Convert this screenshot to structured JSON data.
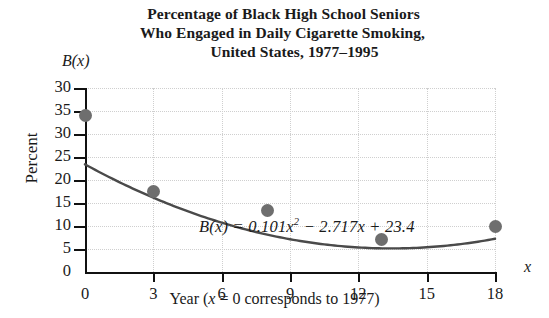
{
  "title": {
    "line1": "Percentage of Black High School Seniors",
    "line2": "Who Engaged in Daily Cigarette Smoking,",
    "line3": "United States, 1977–1995"
  },
  "axes": {
    "y_function_label": "B(x)",
    "y_axis_label": "Percent",
    "x_variable_label": "x",
    "x_axis_caption": "Year (x = 0 corresponds to 1977)"
  },
  "equation": {
    "full": "B(x) = 0.101x² − 2.717x + 23.4",
    "lhs": "B(x)",
    "equals": "=",
    "coef_quadratic": "0.101",
    "term_x_squared_base": "x",
    "exponent": "2",
    "minus": "−",
    "coef_linear": "2.717",
    "term_x": "x",
    "plus": "+",
    "constant": "23.4"
  },
  "colors": {
    "marker": "#6e6e6e",
    "curve": "#4a4a4a",
    "axis": "#111111",
    "grid": "#cfcfcf",
    "text": "#1a1a1a",
    "background": "#ffffff"
  },
  "chart_data": {
    "type": "scatter",
    "title": "Percentage of Black High School Seniors Who Engaged in Daily Cigarette Smoking, United States, 1977–1995",
    "xlabel": "Year (x = 0 corresponds to 1977)",
    "ylabel": "Percent",
    "grid": true,
    "legend": "none",
    "xlim": [
      0,
      18
    ],
    "ylim": [
      0,
      40
    ],
    "xticks": [
      0,
      3,
      6,
      9,
      12,
      15,
      18
    ],
    "xtick_labels": [
      "0",
      "3",
      "6",
      "9",
      "12",
      "15",
      "18"
    ],
    "yticks": [
      0,
      5,
      10,
      15,
      20,
      25,
      30,
      35,
      40
    ],
    "ytick_labels": [
      "0",
      "5",
      "10",
      "15",
      "20",
      "25",
      "30",
      "35",
      "30"
    ],
    "ytick_labels_note": "topmost printed label reads 30 in the source image",
    "points": [
      {
        "x": 0,
        "y": 34.0
      },
      {
        "x": 3,
        "y": 17.5
      },
      {
        "x": 8,
        "y": 13.3
      },
      {
        "x": 13,
        "y": 7.0
      },
      {
        "x": 18,
        "y": 9.8
      }
    ],
    "fit_curve": {
      "label": "B(x) = 0.101x² − 2.717x + 23.4",
      "type": "quadratic",
      "a": 0.101,
      "b": -2.717,
      "c": 23.4,
      "x_range": [
        0,
        18
      ]
    },
    "annotations": [
      {
        "text": "B(x) = 0.101x² − 2.717x + 23.4",
        "x": 4.0,
        "y": 24.5
      }
    ]
  }
}
